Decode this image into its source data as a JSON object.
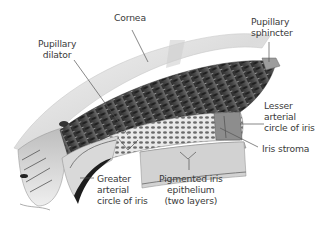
{
  "diagram": {
    "labels": {
      "cornea": "Cornea",
      "pupillary_sphincter": "Pupillary\nsphincter",
      "pupillary_dilator": "Pupillary\ndilator",
      "lesser_arterial_circle": "Lesser\narterial\ncircle of iris",
      "iris_stroma": "Iris stroma",
      "greater_arterial_circle": "Greater\narterial\ncircle of iris",
      "pigmented_iris_epithelium": "Pigmented iris\nepithelium\n(two layers)"
    },
    "colors": {
      "label_text": "#3a3a3a",
      "leader_line": "#555555",
      "tissue_dark": "#3b3b3b",
      "tissue_mid": "#8a8a8a",
      "tissue_light": "#d6d6d6",
      "cornea": "#e6e6e6",
      "background": "#ffffff"
    }
  }
}
